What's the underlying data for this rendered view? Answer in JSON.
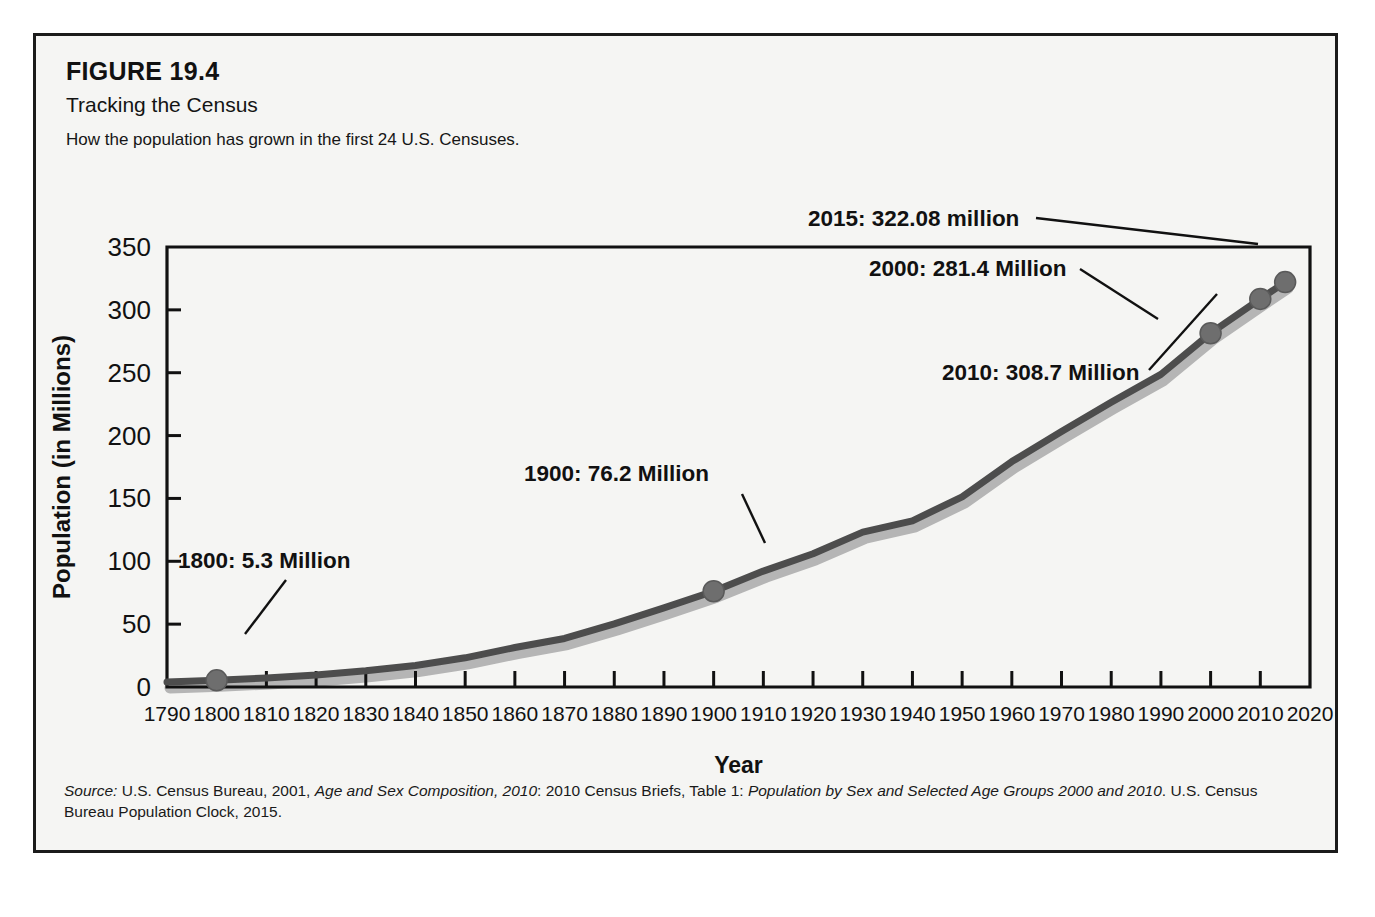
{
  "figure": {
    "number": "FIGURE 19.4",
    "title": "Tracking the Census",
    "subtitle": "How the population has grown in the first 24 U.S. Censuses.",
    "source_prefix": "Source:",
    "source_part1": " U.S. Census Bureau, 2001, ",
    "source_italic1": "Age and Sex Composition, 2010",
    "source_part2": ": 2010 Census Briefs, Table 1: ",
    "source_italic2": "Population by Sex and Selected Age Groups 2000 and 2010",
    "source_part3": ". U.S. Census Bureau Population Clock, 2015.",
    "border_color": "#1b1b1b",
    "background_color": "#f5f5f3"
  },
  "chart_data": {
    "type": "line",
    "title": "Tracking the Census",
    "subtitle": "How the population has grown in the first 24 U.S. Censuses.",
    "xlabel": "Year",
    "ylabel": "Population (in Millions)",
    "xlim": [
      1790,
      2020
    ],
    "ylim": [
      0,
      350
    ],
    "grid": false,
    "legend": "none",
    "line_color": "#4d4d4d",
    "shadow_color": "#b5b5b5",
    "marker_color": "#6e6e6e",
    "x_ticks": [
      "1790",
      "1800",
      "1810",
      "1820",
      "1830",
      "1840",
      "1850",
      "1860",
      "1870",
      "1880",
      "1890",
      "1900",
      "1910",
      "1920",
      "1930",
      "1940",
      "1950",
      "1960",
      "1970",
      "1980",
      "1990",
      "2000",
      "2010",
      "2020"
    ],
    "y_ticks": [
      "0",
      "50",
      "100",
      "150",
      "200",
      "250",
      "300",
      "350"
    ],
    "x": [
      1790,
      1800,
      1810,
      1820,
      1830,
      1840,
      1850,
      1860,
      1870,
      1880,
      1890,
      1900,
      1910,
      1920,
      1930,
      1940,
      1950,
      1960,
      1970,
      1980,
      1990,
      2000,
      2010,
      2015
    ],
    "values": [
      3.9,
      5.3,
      7.2,
      9.6,
      12.9,
      17.1,
      23.2,
      31.4,
      38.6,
      50.2,
      62.9,
      76.2,
      92.2,
      106.0,
      123.2,
      132.2,
      151.3,
      179.3,
      203.2,
      226.5,
      248.7,
      281.4,
      308.7,
      322.08
    ],
    "annotations": [
      {
        "id": "ann-1800",
        "label": "1800: 5.3 Million",
        "x": 1800,
        "y": 5.3
      },
      {
        "id": "ann-1900",
        "label": "1900: 76.2 Million",
        "x": 1900,
        "y": 76.2
      },
      {
        "id": "ann-2000",
        "label": "2000: 281.4 Million",
        "x": 2000,
        "y": 281.4
      },
      {
        "id": "ann-2010",
        "label": "2010: 308.7 Million",
        "x": 2010,
        "y": 308.7
      },
      {
        "id": "ann-2015",
        "label": "2015: 322.08 million",
        "x": 2015,
        "y": 322.08
      }
    ],
    "marked_points": [
      1800,
      1900,
      2000,
      2010,
      2015
    ]
  }
}
